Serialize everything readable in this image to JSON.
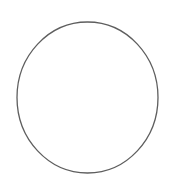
{
  "canvas": {
    "width": 174,
    "height": 182,
    "background_color": "#ffffff",
    "description": "circle-outline-figure"
  },
  "figure": {
    "name": "circle",
    "shape_type": "ellipse",
    "stroke_color": "#5e5e5e",
    "stroke_width": 1.3,
    "fill_color": "none",
    "center_x": 87.5,
    "center_y": 97.5,
    "radius_x": 70.5,
    "radius_y": 75.5,
    "bounds": {
      "left": 17,
      "top": 22,
      "right": 158,
      "bottom": 173,
      "width": 141,
      "height": 151
    },
    "label": ""
  },
  "chart_data": {
    "type": "diagram",
    "title": "",
    "shapes": [
      {
        "kind": "ellipse",
        "cx": 87.5,
        "cy": 97.5,
        "rx": 70.5,
        "ry": 75.5,
        "stroke": "#5e5e5e",
        "stroke_width": 1.3,
        "fill": "none"
      }
    ],
    "annotations": [],
    "legend": []
  }
}
